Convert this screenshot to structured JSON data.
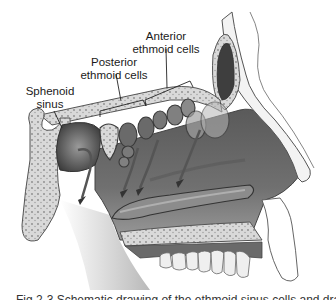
{
  "figure": {
    "style": "grayscale medical illustration",
    "labels": [
      {
        "id": "anterior",
        "line1": "Anterior",
        "line2": "ethmoid cells"
      },
      {
        "id": "posterior",
        "line1": "Posterior",
        "line2": "ethmoid cells"
      },
      {
        "id": "sphenoid",
        "line1": "Sphenoid",
        "line2": "sinus"
      }
    ],
    "caption": "Fig 2-3 Schematic drawing of the ethmoid sinus cells and drainage",
    "caption_note": "caption clipped at bottom edge; text not fully legible"
  },
  "colors": {
    "background": "#ffffff",
    "bone_fill": "#d8d8d8",
    "bone_outline": "#555555",
    "cavity_dark": "#4a4a4a",
    "cavity_mid": "#777777",
    "soft_light": "#e9e9e9",
    "text": "#1a1a1a"
  }
}
